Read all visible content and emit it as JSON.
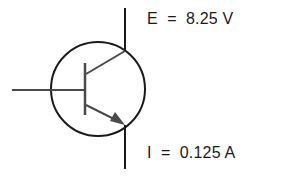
{
  "diagram": {
    "labels": {
      "voltage": "E  =  8.25 V",
      "current": "I  =  0.125 A"
    },
    "values": {
      "voltage": {
        "symbol": "E",
        "value": 8.25,
        "unit": "V"
      },
      "current": {
        "symbol": "I",
        "value": 0.125,
        "unit": "A"
      }
    },
    "colors": {
      "stroke": "#1a1a1a",
      "inner_stroke": "#4a4a4a",
      "background": "#ffffff"
    }
  }
}
